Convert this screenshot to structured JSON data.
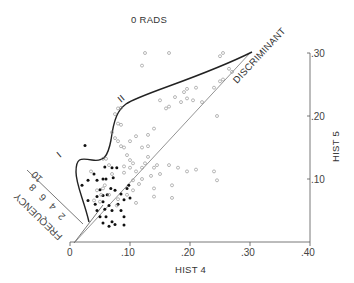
{
  "chart_data": {
    "type": "scatter",
    "title": "0 RADS",
    "xlabel": "HIST 4",
    "ylabel": "HIST 5",
    "xlim": [
      0,
      0.4
    ],
    "ylim": [
      0,
      0.3
    ],
    "x_ticks": [
      "0",
      ".10",
      ".20",
      ".30",
      ".40"
    ],
    "y_ticks": [
      ".10",
      ".20",
      ".30"
    ],
    "grid": false,
    "annotations": {
      "discriminant_label": "DISCRIMINANT",
      "curve_label_1": "I",
      "curve_label_2": "II",
      "frequency_label": "FREQUENCY",
      "frequency_ticks": [
        "2",
        "4",
        "6",
        "8",
        "10"
      ]
    },
    "series": [
      {
        "name": "filled",
        "marker": "filled-circle",
        "points": [
          [
            0.025,
            0.153
          ],
          [
            0.04,
            0.108
          ],
          [
            0.058,
            0.119
          ],
          [
            0.07,
            0.118
          ],
          [
            0.078,
            0.118
          ],
          [
            0.03,
            0.098
          ],
          [
            0.045,
            0.098
          ],
          [
            0.055,
            0.1
          ],
          [
            0.06,
            0.1
          ],
          [
            0.072,
            0.102
          ],
          [
            0.02,
            0.09
          ],
          [
            0.05,
            0.083
          ],
          [
            0.068,
            0.085
          ],
          [
            0.045,
            0.072
          ],
          [
            0.055,
            0.074
          ],
          [
            0.062,
            0.075
          ],
          [
            0.042,
            0.06
          ],
          [
            0.055,
            0.064
          ],
          [
            0.03,
            0.066
          ],
          [
            0.075,
            0.082
          ],
          [
            0.085,
            0.076
          ],
          [
            0.09,
            0.067
          ],
          [
            0.095,
            0.085
          ],
          [
            0.098,
            0.09
          ],
          [
            0.1,
            0.07
          ],
          [
            0.08,
            0.06
          ],
          [
            0.065,
            0.058
          ],
          [
            0.07,
            0.05
          ],
          [
            0.085,
            0.05
          ],
          [
            0.09,
            0.04
          ],
          [
            0.05,
            0.04
          ],
          [
            0.06,
            0.04
          ],
          [
            0.07,
            0.032
          ],
          [
            0.075,
            0.028
          ],
          [
            0.065,
            0.025
          ],
          [
            0.055,
            0.03
          ],
          [
            0.09,
            0.027
          ],
          [
            0.045,
            0.05
          ],
          [
            0.058,
            0.052
          ]
        ]
      },
      {
        "name": "open",
        "marker": "open-circle",
        "points": [
          [
            0.125,
            0.3
          ],
          [
            0.12,
            0.28
          ],
          [
            0.165,
            0.3
          ],
          [
            0.255,
            0.3
          ],
          [
            0.25,
            0.295
          ],
          [
            0.265,
            0.275
          ],
          [
            0.27,
            0.27
          ],
          [
            0.255,
            0.258
          ],
          [
            0.25,
            0.255
          ],
          [
            0.24,
            0.245
          ],
          [
            0.21,
            0.245
          ],
          [
            0.195,
            0.243
          ],
          [
            0.19,
            0.238
          ],
          [
            0.205,
            0.225
          ],
          [
            0.22,
            0.222
          ],
          [
            0.185,
            0.222
          ],
          [
            0.175,
            0.23
          ],
          [
            0.165,
            0.215
          ],
          [
            0.15,
            0.225
          ],
          [
            0.16,
            0.212
          ],
          [
            0.245,
            0.2
          ],
          [
            0.195,
            0.228
          ],
          [
            0.08,
            0.212
          ],
          [
            0.085,
            0.213
          ],
          [
            0.075,
            0.203
          ],
          [
            0.08,
            0.188
          ],
          [
            0.085,
            0.186
          ],
          [
            0.07,
            0.174
          ],
          [
            0.075,
            0.165
          ],
          [
            0.08,
            0.16
          ],
          [
            0.085,
            0.152
          ],
          [
            0.09,
            0.15
          ],
          [
            0.1,
            0.16
          ],
          [
            0.11,
            0.168
          ],
          [
            0.13,
            0.17
          ],
          [
            0.14,
            0.18
          ],
          [
            0.12,
            0.15
          ],
          [
            0.13,
            0.152
          ],
          [
            0.095,
            0.138
          ],
          [
            0.1,
            0.13
          ],
          [
            0.09,
            0.12
          ],
          [
            0.1,
            0.118
          ],
          [
            0.11,
            0.112
          ],
          [
            0.105,
            0.125
          ],
          [
            0.12,
            0.118
          ],
          [
            0.125,
            0.125
          ],
          [
            0.13,
            0.135
          ],
          [
            0.14,
            0.118
          ],
          [
            0.145,
            0.122
          ],
          [
            0.135,
            0.105
          ],
          [
            0.15,
            0.108
          ],
          [
            0.165,
            0.122
          ],
          [
            0.18,
            0.118
          ],
          [
            0.195,
            0.112
          ],
          [
            0.21,
            0.115
          ],
          [
            0.24,
            0.112
          ],
          [
            0.245,
            0.098
          ],
          [
            0.14,
            0.085
          ],
          [
            0.14,
            0.072
          ],
          [
            0.17,
            0.09
          ],
          [
            0.17,
            0.07
          ],
          [
            0.12,
            0.1
          ],
          [
            0.115,
            0.092
          ],
          [
            0.105,
            0.082
          ],
          [
            0.095,
            0.075
          ],
          [
            0.11,
            0.062
          ],
          [
            0.045,
            0.082
          ],
          [
            0.055,
            0.085
          ],
          [
            0.058,
            0.09
          ],
          [
            0.04,
            0.066
          ],
          [
            0.05,
            0.064
          ],
          [
            0.052,
            0.075
          ],
          [
            0.065,
            0.075
          ],
          [
            0.035,
            0.112
          ],
          [
            0.07,
            0.108
          ],
          [
            0.065,
            0.122
          ],
          [
            0.055,
            0.132
          ],
          [
            0.06,
            0.132
          ],
          [
            0.09,
            0.11
          ],
          [
            0.105,
            0.098
          ],
          [
            0.08,
            0.068
          ],
          [
            0.078,
            0.058
          ]
        ]
      }
    ],
    "curves": {
      "discriminant_line": [
        [
          0.025,
          0.0
        ],
        [
          0.29,
          0.3
        ]
      ],
      "boundary_curve": "S-shaped curve from (0.03,0.035) up through (0.02,0.13), dipping to (0.06,0.13), rising to (0.07,0.21) then curving to (0.29,0.30)"
    }
  }
}
